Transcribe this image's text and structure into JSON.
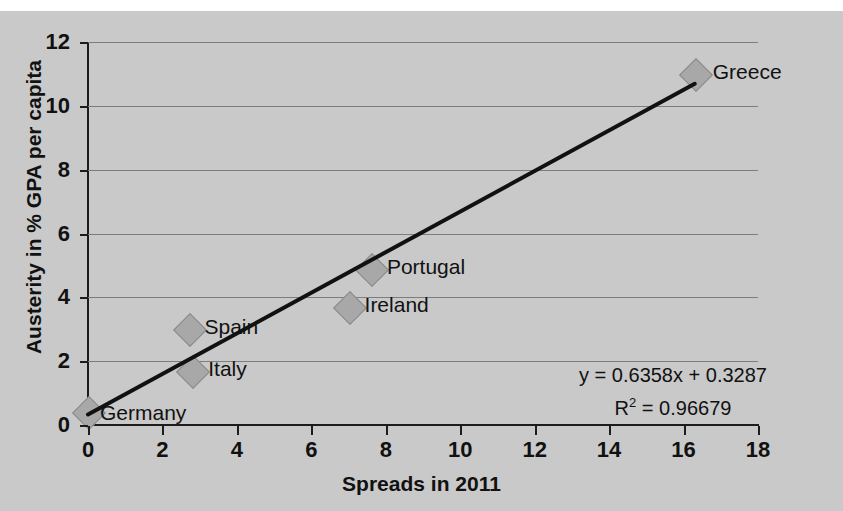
{
  "chart_data": {
    "type": "scatter",
    "title": "",
    "xlabel": "Spreads in 2011",
    "ylabel": "Austerity in % GPA per capita",
    "xlim": [
      0,
      18
    ],
    "ylim": [
      0,
      12
    ],
    "xticks": [
      0,
      2,
      4,
      6,
      8,
      10,
      12,
      14,
      16,
      18
    ],
    "yticks": [
      0,
      2,
      4,
      6,
      8,
      10,
      12
    ],
    "grid": "horizontal",
    "legend": "none",
    "points": [
      {
        "label": "Germany",
        "x": 0.0,
        "y": 0.4
      },
      {
        "label": "Italy",
        "x": 2.8,
        "y": 1.7
      },
      {
        "label": "Spain",
        "x": 2.7,
        "y": 3.0
      },
      {
        "label": "Ireland",
        "x": 7.0,
        "y": 3.7
      },
      {
        "label": "Portugal",
        "x": 7.6,
        "y": 4.9
      },
      {
        "label": "Greece",
        "x": 16.3,
        "y": 11.0
      }
    ],
    "trendline": {
      "type": "linear",
      "slope": 0.6358,
      "intercept": 0.3287,
      "r_squared": 0.96679,
      "equation_text": "y = 0.6358x + 0.3287",
      "r2_text_prefix": "R",
      "r2_text_suffix": " = 0.96679",
      "r2_superscript": "2"
    },
    "colors": {
      "background": "#c9c9c9",
      "marker_fill": "#a8a8a8",
      "marker_stroke": "#8a8a8a",
      "trendline": "#111111",
      "gridline": "#7d7d7d",
      "axis": "#1c1c1c",
      "text": "#111111"
    }
  }
}
